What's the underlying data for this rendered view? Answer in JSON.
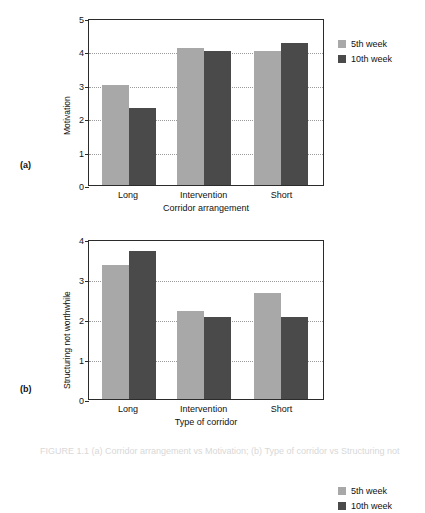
{
  "figure": {
    "caption": "FIGURE 1.1   (a) Corridor arrangement vs Motivation; (b) Type of corridor vs Structuring not worthwhile"
  },
  "colors": {
    "series_5th_week": "#a8a8a8",
    "series_10th_week": "#4a4a4a",
    "axis": "#2b2b2b",
    "gridline": "#9a9a9a",
    "background": "#ffffff"
  },
  "panels": {
    "a": {
      "letter": "(a)",
      "legend": [
        {
          "label": "5th week"
        },
        {
          "label": "10th week"
        }
      ]
    },
    "b": {
      "letter": "(b)",
      "legend": [
        {
          "label": "5th week"
        },
        {
          "label": "10th week"
        }
      ]
    }
  },
  "chart_data": [
    {
      "id": "a",
      "type": "bar",
      "title": "",
      "xlabel": "Corridor arrangement",
      "ylabel": "Motivation",
      "categories": [
        "Long",
        "Intervention",
        "Short"
      ],
      "series": [
        {
          "name": "5th week",
          "color": "#a8a8a8",
          "values": [
            3.0,
            4.1,
            4.0
          ]
        },
        {
          "name": "10th week",
          "color": "#4a4a4a",
          "values": [
            2.3,
            4.0,
            4.25
          ]
        }
      ],
      "ylim": [
        0,
        5
      ],
      "yticks": [
        0,
        1,
        2,
        3,
        4,
        5
      ],
      "ytick_labels": [
        "0",
        "1",
        "2",
        "3",
        "4",
        "5"
      ],
      "grid": true,
      "grid_axis": "y",
      "legend_position": "right"
    },
    {
      "id": "b",
      "type": "bar",
      "title": "",
      "xlabel": "Type of corridor",
      "ylabel": "Structuring not worthwhile",
      "categories": [
        "Long",
        "Intervention",
        "Short"
      ],
      "series": [
        {
          "name": "5th week",
          "color": "#a8a8a8",
          "values": [
            3.35,
            2.2,
            2.65
          ]
        },
        {
          "name": "10th week",
          "color": "#4a4a4a",
          "values": [
            3.7,
            2.05,
            2.05
          ]
        }
      ],
      "ylim": [
        0,
        4
      ],
      "yticks": [
        0,
        1,
        2,
        3,
        4
      ],
      "ytick_labels": [
        "0",
        "1",
        "2",
        "3",
        "4"
      ],
      "grid": true,
      "grid_axis": "y",
      "legend_position": "right"
    }
  ]
}
